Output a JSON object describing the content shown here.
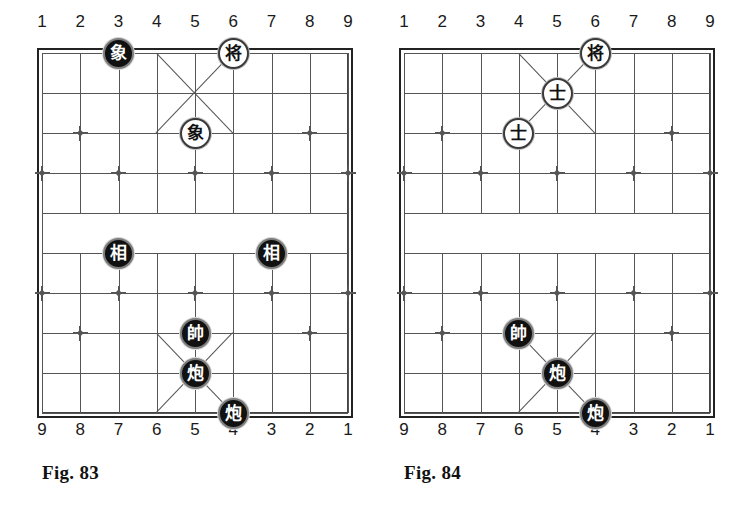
{
  "page": {
    "background": "#ffffff",
    "ink": "#222222"
  },
  "figures": [
    {
      "id": "fig-83",
      "caption": "Fig. 83",
      "top_file_labels": [
        "1",
        "2",
        "3",
        "4",
        "5",
        "6",
        "7",
        "8",
        "9"
      ],
      "bottom_file_labels": [
        "9",
        "8",
        "7",
        "6",
        "5",
        "4",
        "3",
        "2",
        "1"
      ],
      "geometry": {
        "left": 42,
        "top": 53,
        "cols": 9,
        "rows": 10,
        "col_step": 38.25,
        "row_step": 40
      },
      "pieces": [
        {
          "glyph": "象",
          "name": "black-elephant",
          "color": "black",
          "col": 2,
          "row": 0,
          "top_file": "3"
        },
        {
          "glyph": "将",
          "name": "black-general",
          "color": "white",
          "col": 5,
          "row": 0,
          "top_file": "6"
        },
        {
          "glyph": "象",
          "name": "black-elephant",
          "color": "white",
          "col": 4,
          "row": 2,
          "top_file": "5"
        },
        {
          "glyph": "相",
          "name": "red-minister",
          "color": "black",
          "col": 2,
          "row": 5,
          "top_file": "3"
        },
        {
          "glyph": "相",
          "name": "red-minister",
          "color": "black",
          "col": 6,
          "row": 5,
          "top_file": "7"
        },
        {
          "glyph": "帥",
          "name": "red-general",
          "color": "black",
          "col": 4,
          "row": 7,
          "top_file": "5"
        },
        {
          "glyph": "炮",
          "name": "red-cannon",
          "color": "black",
          "col": 4,
          "row": 8,
          "top_file": "5"
        },
        {
          "glyph": "炮",
          "name": "red-cannon",
          "color": "black",
          "col": 5,
          "row": 9,
          "top_file": "6"
        }
      ]
    },
    {
      "id": "fig-84",
      "caption": "Fig. 84",
      "top_file_labels": [
        "1",
        "2",
        "3",
        "4",
        "5",
        "6",
        "7",
        "8",
        "9"
      ],
      "bottom_file_labels": [
        "9",
        "8",
        "7",
        "6",
        "5",
        "4",
        "3",
        "2",
        "1"
      ],
      "geometry": {
        "left": 24,
        "top": 53,
        "cols": 9,
        "rows": 10,
        "col_step": 38.25,
        "row_step": 40
      },
      "pieces": [
        {
          "glyph": "将",
          "name": "black-general",
          "color": "white",
          "col": 5,
          "row": 0,
          "top_file": "6"
        },
        {
          "glyph": "士",
          "name": "black-advisor",
          "color": "white",
          "col": 4,
          "row": 1,
          "top_file": "5"
        },
        {
          "glyph": "士",
          "name": "black-advisor",
          "color": "white",
          "col": 3,
          "row": 2,
          "top_file": "4"
        },
        {
          "glyph": "帥",
          "name": "red-general",
          "color": "black",
          "col": 3,
          "row": 7,
          "top_file": "4"
        },
        {
          "glyph": "炮",
          "name": "red-cannon",
          "color": "black",
          "col": 4,
          "row": 8,
          "top_file": "5"
        },
        {
          "glyph": "炮",
          "name": "red-cannon",
          "color": "black",
          "col": 5,
          "row": 9,
          "top_file": "6"
        }
      ]
    }
  ],
  "star_points": [
    {
      "col": 1,
      "row": 2
    },
    {
      "col": 7,
      "row": 2
    },
    {
      "col": 0,
      "row": 3
    },
    {
      "col": 2,
      "row": 3
    },
    {
      "col": 4,
      "row": 3
    },
    {
      "col": 6,
      "row": 3
    },
    {
      "col": 8,
      "row": 3
    },
    {
      "col": 0,
      "row": 6
    },
    {
      "col": 2,
      "row": 6
    },
    {
      "col": 4,
      "row": 6
    },
    {
      "col": 6,
      "row": 6
    },
    {
      "col": 8,
      "row": 6
    },
    {
      "col": 1,
      "row": 7
    },
    {
      "col": 7,
      "row": 7
    }
  ]
}
